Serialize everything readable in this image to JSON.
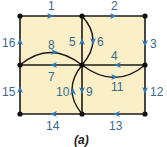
{
  "diagram": {
    "caption": "(a)",
    "fill_color": "#fbefc8",
    "edge_color": "#1a1a1a",
    "arrow_color": "#2e7bbf",
    "label_color": "#3a6a8a",
    "nodes": [
      {
        "id": "A",
        "x": 20,
        "y": 16
      },
      {
        "id": "B",
        "x": 82,
        "y": 16
      },
      {
        "id": "C",
        "x": 145,
        "y": 16
      },
      {
        "id": "D",
        "x": 20,
        "y": 65
      },
      {
        "id": "E",
        "x": 82,
        "y": 65
      },
      {
        "id": "F",
        "x": 145,
        "y": 65
      },
      {
        "id": "G",
        "x": 20,
        "y": 114
      },
      {
        "id": "H",
        "x": 82,
        "y": 114
      },
      {
        "id": "I",
        "x": 145,
        "y": 114
      }
    ],
    "edges": [
      {
        "label": "1",
        "from": "A",
        "to": "B",
        "direction": "right"
      },
      {
        "label": "2",
        "from": "B",
        "to": "C",
        "direction": "right"
      },
      {
        "label": "3",
        "from": "C",
        "to": "F",
        "direction": "down"
      },
      {
        "label": "4",
        "from": "F",
        "to": "E",
        "direction": "left"
      },
      {
        "label": "5",
        "from": "E",
        "to": "B",
        "direction": "up"
      },
      {
        "label": "6",
        "from": "B",
        "to": "E",
        "direction": "down",
        "curved": true
      },
      {
        "label": "7",
        "from": "E",
        "to": "D",
        "direction": "left"
      },
      {
        "label": "8",
        "from": "D",
        "to": "E",
        "direction": "right",
        "curved": true
      },
      {
        "label": "9",
        "from": "E",
        "to": "H",
        "direction": "down"
      },
      {
        "label": "10",
        "from": "H",
        "to": "E",
        "direction": "up",
        "curved": true
      },
      {
        "label": "11",
        "from": "E",
        "to": "F",
        "direction": "right",
        "curved": true
      },
      {
        "label": "12",
        "from": "F",
        "to": "I",
        "direction": "down"
      },
      {
        "label": "13",
        "from": "I",
        "to": "H",
        "direction": "left"
      },
      {
        "label": "14",
        "from": "H",
        "to": "G",
        "direction": "left"
      },
      {
        "label": "15",
        "from": "G",
        "to": "D",
        "direction": "up"
      },
      {
        "label": "16",
        "from": "D",
        "to": "A",
        "direction": "up"
      }
    ],
    "labels": {
      "e1": "1",
      "e2": "2",
      "e3": "3",
      "e4": "4",
      "e5": "5",
      "e6": "6",
      "e7": "7",
      "e8": "8",
      "e9": "9",
      "e10": "10",
      "e11": "11",
      "e12": "12",
      "e13": "13",
      "e14": "14",
      "e15": "15",
      "e16": "16"
    }
  }
}
